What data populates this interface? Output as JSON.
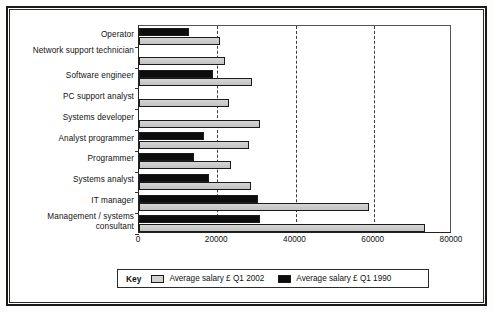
{
  "chart_data": {
    "type": "bar",
    "orientation": "horizontal",
    "title": "",
    "xlabel": "",
    "ylabel": "",
    "xlim": [
      0,
      80000
    ],
    "xticks": [
      0,
      20000,
      40000,
      60000,
      80000
    ],
    "xtick_labels": [
      "0",
      "20000",
      "40000",
      "60000",
      "80000"
    ],
    "grid": "vertical-dashed",
    "legend_position": "bottom",
    "legend_title": "Key",
    "categories": [
      "Operator",
      "Network support technician",
      "Software engineer",
      "PC support analyst",
      "Systems developer",
      "Analyst programmer",
      "Programmer",
      "Systems analyst",
      "IT manager",
      "Management / systems consultant"
    ],
    "series": [
      {
        "name": "Average salary £ Q1 2002",
        "color": "#c9c9c9",
        "values": [
          20800,
          22000,
          29000,
          23000,
          31000,
          28000,
          23400,
          28500,
          58700,
          73000
        ]
      },
      {
        "name": "Average salary £ Q1 1990",
        "color": "#0d0d0d",
        "values": [
          12800,
          0,
          19000,
          0,
          0,
          16500,
          14000,
          18000,
          30500,
          31000
        ]
      }
    ]
  },
  "legend": {
    "key_label": "Key",
    "entries": [
      {
        "label": "Average salary £ Q1 2002",
        "swatch": "light-gray"
      },
      {
        "label": "Average salary £ Q1 1990",
        "swatch": "black"
      }
    ]
  }
}
